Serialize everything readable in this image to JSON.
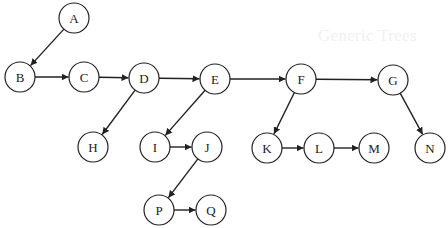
{
  "background_bleed_text": "Generic Trees",
  "diagram": {
    "type": "directed-tree",
    "node_radius": 15,
    "stroke_color": "#222222",
    "fill_color": "#ffffff",
    "nodes": [
      {
        "id": "A",
        "label": "A",
        "x": 74,
        "y": 18
      },
      {
        "id": "B",
        "label": "B",
        "x": 20,
        "y": 77
      },
      {
        "id": "C",
        "label": "C",
        "x": 84,
        "y": 77
      },
      {
        "id": "D",
        "label": "D",
        "x": 144,
        "y": 78
      },
      {
        "id": "E",
        "label": "E",
        "x": 215,
        "y": 79
      },
      {
        "id": "F",
        "label": "F",
        "x": 301,
        "y": 79
      },
      {
        "id": "G",
        "label": "G",
        "x": 393,
        "y": 80
      },
      {
        "id": "H",
        "label": "H",
        "x": 93,
        "y": 147
      },
      {
        "id": "I",
        "label": "I",
        "x": 155,
        "y": 147
      },
      {
        "id": "J",
        "label": "J",
        "x": 207,
        "y": 147
      },
      {
        "id": "K",
        "label": "K",
        "x": 267,
        "y": 148
      },
      {
        "id": "L",
        "label": "L",
        "x": 319,
        "y": 148
      },
      {
        "id": "M",
        "label": "M",
        "x": 374,
        "y": 148
      },
      {
        "id": "N",
        "label": "N",
        "x": 430,
        "y": 148
      },
      {
        "id": "P",
        "label": "P",
        "x": 159,
        "y": 210
      },
      {
        "id": "Q",
        "label": "Q",
        "x": 211,
        "y": 210
      }
    ],
    "edges": [
      {
        "from": "A",
        "to": "B"
      },
      {
        "from": "B",
        "to": "C"
      },
      {
        "from": "C",
        "to": "D"
      },
      {
        "from": "D",
        "to": "E"
      },
      {
        "from": "E",
        "to": "F"
      },
      {
        "from": "F",
        "to": "G"
      },
      {
        "from": "D",
        "to": "H"
      },
      {
        "from": "E",
        "to": "I"
      },
      {
        "from": "I",
        "to": "J"
      },
      {
        "from": "J",
        "to": "P"
      },
      {
        "from": "P",
        "to": "Q"
      },
      {
        "from": "F",
        "to": "K"
      },
      {
        "from": "K",
        "to": "L"
      },
      {
        "from": "L",
        "to": "M"
      },
      {
        "from": "G",
        "to": "N"
      }
    ]
  }
}
